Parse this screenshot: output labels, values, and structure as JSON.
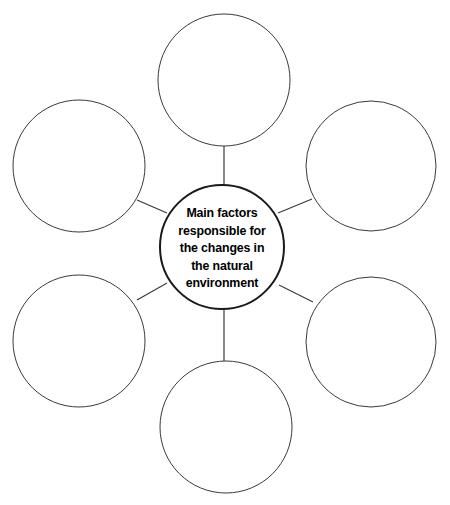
{
  "diagram": {
    "type": "mind-map",
    "canvas": {
      "width": 450,
      "height": 505,
      "background": "#ffffff"
    },
    "stroke_colors": {
      "satellite_outline": "#3a3a3a",
      "center_outline": "#1a1a1a",
      "connector": "#3a3a3a"
    },
    "text_color": "#000000",
    "center": {
      "name": "main-topic",
      "cx": 222,
      "cy": 247,
      "r": 63,
      "stroke_width": 2,
      "text_lines": [
        "Main factors",
        "responsible for",
        "the changes in",
        "the natural",
        "environment"
      ],
      "full_text": "Main factors responsible for the changes in the natural environment"
    },
    "satellites": [
      {
        "name": "node-top",
        "position": "top",
        "cx": 224,
        "cy": 80,
        "r": 66,
        "stroke_width": 1,
        "label": ""
      },
      {
        "name": "node-top-left",
        "position": "top-left",
        "cx": 79,
        "cy": 166,
        "r": 66,
        "stroke_width": 1,
        "label": ""
      },
      {
        "name": "node-top-right",
        "position": "top-right",
        "cx": 371,
        "cy": 166,
        "r": 65,
        "stroke_width": 1,
        "label": ""
      },
      {
        "name": "node-bottom-left",
        "position": "bottom-left",
        "cx": 79,
        "cy": 341,
        "r": 66,
        "stroke_width": 1,
        "label": ""
      },
      {
        "name": "node-bottom-right",
        "position": "bottom-right",
        "cx": 371,
        "cy": 342,
        "r": 65,
        "stroke_width": 1,
        "label": ""
      },
      {
        "name": "node-bottom",
        "position": "bottom",
        "cx": 226,
        "cy": 427,
        "r": 66,
        "stroke_width": 1,
        "label": ""
      }
    ],
    "connectors": [
      {
        "name": "connector-center-to-top",
        "x1": 224,
        "y1": 185,
        "x2": 224,
        "y2": 146
      },
      {
        "name": "connector-center-to-top-left",
        "x1": 167,
        "y1": 213,
        "x2": 137,
        "y2": 200
      },
      {
        "name": "connector-center-to-top-right",
        "x1": 278,
        "y1": 213,
        "x2": 312,
        "y2": 199
      },
      {
        "name": "connector-center-to-bottom-left",
        "x1": 167,
        "y1": 283,
        "x2": 137,
        "y2": 300
      },
      {
        "name": "connector-center-to-bottom-right",
        "x1": 279,
        "y1": 285,
        "x2": 313,
        "y2": 302
      },
      {
        "name": "connector-center-to-bottom",
        "x1": 224,
        "y1": 310,
        "x2": 224,
        "y2": 361
      }
    ]
  }
}
